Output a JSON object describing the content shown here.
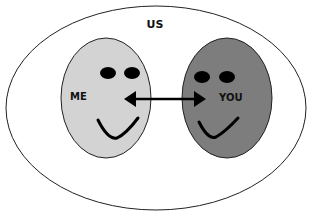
{
  "diagram": {
    "outer_label": "US",
    "left_face_label": "ME",
    "right_face_label": "YOU",
    "relationship": "bidirectional-arrow"
  },
  "colors": {
    "background": "#ffffff",
    "outer_fill": "#ffffff",
    "outline": "#222222",
    "me_fill": "#d3d3d3",
    "you_fill": "#7d7d7d",
    "features": "#000000"
  }
}
